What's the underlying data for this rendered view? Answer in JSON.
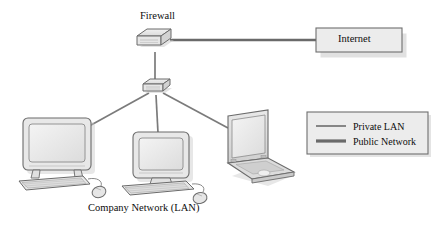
{
  "diagram": {
    "title_caption": "Company Network (LAN)",
    "nodes": {
      "firewall": {
        "label": "Firewall",
        "type": "firewall-appliance"
      },
      "switch": {
        "label": "",
        "type": "network-switch"
      },
      "internet": {
        "label": "Internet",
        "type": "cloud-box"
      },
      "workstation_left": {
        "label": "",
        "type": "desktop-computer"
      },
      "workstation_center": {
        "label": "",
        "type": "desktop-computer"
      },
      "workstation_right": {
        "label": "",
        "type": "laptop-computer"
      }
    },
    "legend": {
      "items": [
        {
          "label": "Private LAN",
          "color": "#7b7b7b",
          "thickness": 1.6
        },
        {
          "label": "Public Network",
          "color": "#6a6a6a",
          "thickness": 3.0
        }
      ]
    },
    "links": [
      {
        "from": "firewall",
        "to": "internet",
        "kind": "Public Network"
      },
      {
        "from": "firewall",
        "to": "switch",
        "kind": "Private LAN"
      },
      {
        "from": "switch",
        "to": "workstation_left",
        "kind": "Private LAN"
      },
      {
        "from": "switch",
        "to": "workstation_center",
        "kind": "Private LAN"
      },
      {
        "from": "switch",
        "to": "workstation_right",
        "kind": "Private LAN"
      }
    ],
    "colors": {
      "background": "#ffffff",
      "line_private": "#7b7b7b",
      "line_public": "#6a6a6a",
      "box_fill": "#ececec",
      "box_stroke": "#6f6f6f",
      "device_fill": "#e4e4e4",
      "device_stroke": "#6b6b6b",
      "shadow": "#c9c9c9",
      "text": "#0d0d0d"
    }
  }
}
